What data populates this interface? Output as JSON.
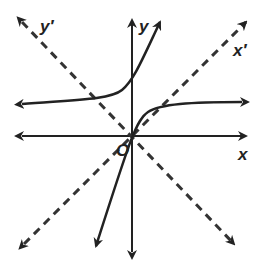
{
  "diagram": {
    "type": "rotated-axes-graph",
    "labels": {
      "x": "x",
      "y": "y",
      "x_prime": "x′",
      "y_prime": "y′",
      "origin": "O"
    },
    "colors": {
      "ink": "#222222",
      "background": "#ffffff"
    },
    "elements": [
      {
        "id": "x-axis",
        "style": "solid",
        "arrows": "both"
      },
      {
        "id": "y-axis",
        "style": "solid",
        "arrows": "both"
      },
      {
        "id": "x-prime-axis",
        "style": "dashed",
        "arrows": "both",
        "angle_deg": 45
      },
      {
        "id": "y-prime-axis",
        "style": "dashed",
        "arrows": "both",
        "angle_deg": 135
      },
      {
        "id": "hyperbola-branch-upper-left",
        "style": "solid",
        "arrows": "both"
      },
      {
        "id": "hyperbola-branch-lower-right",
        "style": "solid",
        "arrows": "both"
      }
    ]
  }
}
